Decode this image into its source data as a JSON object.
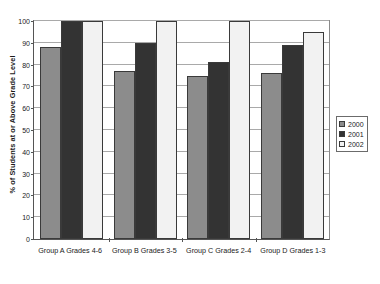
{
  "chart_data": {
    "type": "bar",
    "title": "",
    "xlabel": "",
    "ylabel": "% of Students at or Above Grade Level",
    "ylim": [
      0,
      100
    ],
    "yticks": [
      0,
      10,
      20,
      30,
      40,
      50,
      60,
      70,
      80,
      90,
      100
    ],
    "grid": true,
    "legend_position": "right",
    "categories": [
      "Group A Grades 4-6",
      "Group B Grades 3-5",
      "Group C Grades 2-4",
      "Group D Grades 1-3"
    ],
    "series": [
      {
        "name": "2000",
        "color": "#8c8c8c",
        "values": [
          88,
          77,
          75,
          76
        ]
      },
      {
        "name": "2001",
        "color": "#333333",
        "values": [
          100,
          90,
          81,
          89
        ]
      },
      {
        "name": "2002",
        "color": "#f2f2f2",
        "values": [
          100,
          100,
          100,
          95
        ]
      }
    ]
  },
  "legend": {
    "items": [
      {
        "label": "2000"
      },
      {
        "label": "2001"
      },
      {
        "label": "2002"
      }
    ]
  },
  "axis": {
    "y_title": "% of Students at or Above Grade Level",
    "y_tick_labels": [
      "0",
      "10",
      "20",
      "30",
      "40",
      "50",
      "60",
      "70",
      "80",
      "90",
      "100"
    ]
  }
}
